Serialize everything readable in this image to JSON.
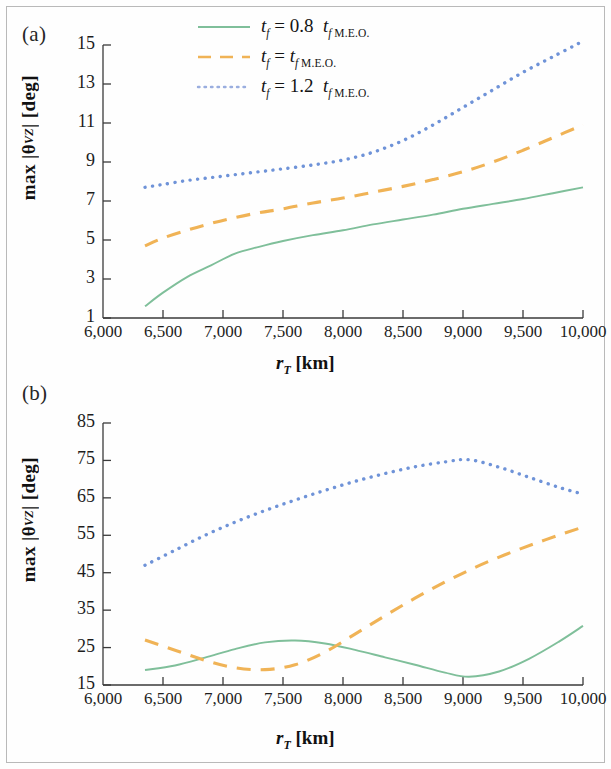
{
  "figure": {
    "panels": [
      {
        "id": "a",
        "label": "(a)"
      },
      {
        "id": "b",
        "label": "(b)"
      }
    ]
  },
  "legend": {
    "position": "top-center",
    "entries": [
      {
        "prefix": "t",
        "sub": "f",
        "eq": "= 0.8",
        "tail": "t",
        "tail_sub": "f M.E.O.",
        "label": "t_f = 0.8 t_f M.E.O.",
        "color": "#7fbf9a",
        "style": "solid"
      },
      {
        "prefix": "t",
        "sub": "f",
        "eq": "=",
        "tail": "t",
        "tail_sub": "f M.E.O.",
        "label": "t_f = t_f M.E.O.",
        "color": "#f0b356",
        "style": "dashed"
      },
      {
        "prefix": "t",
        "sub": "f",
        "eq": "= 1.2",
        "tail": "t",
        "tail_sub": "f M.E.O.",
        "label": "t_f = 1.2 t_f M.E.O.",
        "color": "#6f93d8",
        "style": "dotted"
      }
    ]
  },
  "axis_titles": {
    "y": "max |θ_VZ| [deg]",
    "y_main": "max |θ",
    "y_sub": "VZ",
    "y_tail": "| [deg]",
    "x_main": "r",
    "x_sub": "T",
    "x_tail": "[km]"
  },
  "chart_data": [
    {
      "panel": "a",
      "type": "line",
      "title": "(a)",
      "xlabel": "r_T [km]",
      "ylabel": "max |θ_VZ| [deg]",
      "xlim": [
        6000,
        10000
      ],
      "ylim": [
        1,
        15
      ],
      "xticks": [
        6000,
        6500,
        7000,
        7500,
        8000,
        8500,
        9000,
        9500,
        10000
      ],
      "xtick_labels": [
        "6,000",
        "6,500",
        "7,000",
        "7,500",
        "8,000",
        "8,500",
        "9,000",
        "9,500",
        "10,000"
      ],
      "yticks": [
        1,
        3,
        5,
        7,
        9,
        11,
        13,
        15
      ],
      "ytick_labels": [
        "1",
        "3",
        "5",
        "7",
        "9",
        "11",
        "13",
        "15"
      ],
      "grid": false,
      "legend": "top-center",
      "series": [
        {
          "name": "t_f = 0.8 t_f M.E.O.",
          "color": "#7fbf9a",
          "style": "solid",
          "x": [
            6350,
            6500,
            6700,
            6900,
            7100,
            7300,
            7500,
            7750,
            8000,
            8250,
            8500,
            8750,
            9000,
            9250,
            9500,
            9750,
            10000
          ],
          "y": [
            1.6,
            2.3,
            3.1,
            3.7,
            4.3,
            4.65,
            4.95,
            5.25,
            5.5,
            5.8,
            6.05,
            6.3,
            6.6,
            6.85,
            7.1,
            7.4,
            7.7
          ]
        },
        {
          "name": "t_f = t_f M.E.O.",
          "color": "#f0b356",
          "style": "dashed",
          "x": [
            6350,
            6500,
            6700,
            6900,
            7100,
            7300,
            7500,
            7750,
            8000,
            8250,
            8500,
            8750,
            9000,
            9250,
            9500,
            9750,
            10000
          ],
          "y": [
            4.7,
            5.1,
            5.5,
            5.85,
            6.15,
            6.4,
            6.6,
            6.9,
            7.15,
            7.45,
            7.75,
            8.1,
            8.5,
            9.0,
            9.6,
            10.25,
            10.9
          ]
        },
        {
          "name": "t_f = 1.2 t_f M.E.O.",
          "color": "#6f93d8",
          "style": "dotted",
          "x": [
            6350,
            6500,
            6700,
            6900,
            7100,
            7300,
            7500,
            7750,
            8000,
            8250,
            8500,
            8750,
            9000,
            9250,
            9500,
            9750,
            10000
          ],
          "y": [
            7.7,
            7.85,
            8.05,
            8.2,
            8.35,
            8.5,
            8.65,
            8.85,
            9.1,
            9.5,
            10.1,
            10.9,
            11.8,
            12.7,
            13.6,
            14.4,
            15.2
          ]
        }
      ]
    },
    {
      "panel": "b",
      "type": "line",
      "title": "(b)",
      "xlabel": "r_T [km]",
      "ylabel": "max |θ_VZ| [deg]",
      "xlim": [
        6000,
        10000
      ],
      "ylim": [
        15,
        85
      ],
      "xticks": [
        6000,
        6500,
        7000,
        7500,
        8000,
        8500,
        9000,
        9500,
        10000
      ],
      "xtick_labels": [
        "6,000",
        "6,500",
        "7,000",
        "7,500",
        "8,000",
        "8,500",
        "9,000",
        "9,500",
        "10,000"
      ],
      "yticks": [
        15,
        25,
        35,
        45,
        55,
        65,
        75,
        85
      ],
      "ytick_labels": [
        "15",
        "25",
        "35",
        "45",
        "55",
        "65",
        "75",
        "85"
      ],
      "grid": false,
      "legend": "none",
      "series": [
        {
          "name": "t_f = 0.8 t_f M.E.O.",
          "color": "#7fbf9a",
          "style": "solid",
          "x": [
            6350,
            6600,
            6850,
            7100,
            7350,
            7600,
            7850,
            8100,
            8350,
            8600,
            8850,
            9050,
            9300,
            9550,
            9800,
            10000
          ],
          "y": [
            19.0,
            20.2,
            22.3,
            24.6,
            26.4,
            26.9,
            26.1,
            24.4,
            22.4,
            20.4,
            18.3,
            17.2,
            18.6,
            22.0,
            26.6,
            30.8
          ]
        },
        {
          "name": "t_f = t_f M.E.O.",
          "color": "#f0b356",
          "style": "dashed",
          "x": [
            6350,
            6600,
            6850,
            7100,
            7350,
            7600,
            7850,
            8100,
            8350,
            8600,
            8850,
            9100,
            9350,
            9600,
            9850,
            10000
          ],
          "y": [
            27.0,
            24.3,
            21.6,
            19.6,
            19.1,
            20.4,
            23.8,
            28.6,
            33.5,
            38.2,
            42.5,
            46.4,
            49.8,
            52.8,
            55.6,
            57.2
          ]
        },
        {
          "name": "t_f = 1.2 t_f M.E.O.",
          "color": "#6f93d8",
          "style": "dotted",
          "x": [
            6350,
            6600,
            6850,
            7100,
            7350,
            7600,
            7850,
            8100,
            8350,
            8600,
            8850,
            9050,
            9300,
            9550,
            9800,
            10000
          ],
          "y": [
            47.0,
            51.0,
            55.0,
            58.5,
            61.6,
            64.4,
            67.0,
            69.4,
            71.5,
            73.3,
            74.6,
            75.2,
            73.2,
            70.5,
            67.8,
            66.0
          ]
        }
      ]
    }
  ]
}
